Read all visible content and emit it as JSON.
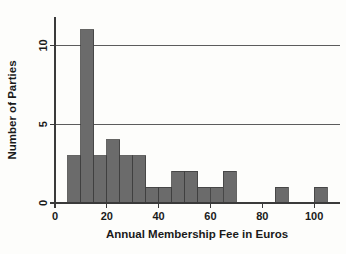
{
  "chart_data": {
    "type": "bar",
    "title": "",
    "xlabel": "Annual Membership Fee in Euros",
    "ylabel": "Number of Parties",
    "xlim": [
      0,
      110
    ],
    "ylim": [
      0,
      11.8
    ],
    "xticks": [
      0,
      20,
      40,
      60,
      80,
      100
    ],
    "xticklabels": [
      "0",
      "20",
      "40",
      "60",
      "80",
      "100"
    ],
    "yticks": [
      0,
      5,
      10
    ],
    "yticklabels": [
      "0",
      "5",
      "10"
    ],
    "grid": "horizontal-at-5-and-10",
    "legend": "none",
    "bin_width": 5,
    "bar_color": "#6b6b6b",
    "bar_edge_color": "#3f3f3f",
    "bins": [
      {
        "start": 5,
        "end": 10,
        "count": 3
      },
      {
        "start": 10,
        "end": 15,
        "count": 11
      },
      {
        "start": 15,
        "end": 20,
        "count": 3
      },
      {
        "start": 20,
        "end": 25,
        "count": 4
      },
      {
        "start": 25,
        "end": 30,
        "count": 3
      },
      {
        "start": 30,
        "end": 35,
        "count": 3
      },
      {
        "start": 35,
        "end": 40,
        "count": 1
      },
      {
        "start": 40,
        "end": 45,
        "count": 1
      },
      {
        "start": 45,
        "end": 50,
        "count": 2
      },
      {
        "start": 50,
        "end": 55,
        "count": 2
      },
      {
        "start": 55,
        "end": 60,
        "count": 1
      },
      {
        "start": 60,
        "end": 65,
        "count": 1
      },
      {
        "start": 65,
        "end": 70,
        "count": 2
      },
      {
        "start": 85,
        "end": 90,
        "count": 1
      },
      {
        "start": 100,
        "end": 105,
        "count": 1
      }
    ],
    "categories": [
      "5-10",
      "10-15",
      "15-20",
      "20-25",
      "25-30",
      "30-35",
      "35-40",
      "40-45",
      "45-50",
      "50-55",
      "55-60",
      "60-65",
      "65-70",
      "85-90",
      "100-105"
    ],
    "values": [
      3,
      11,
      3,
      4,
      3,
      3,
      1,
      1,
      2,
      2,
      1,
      1,
      2,
      1,
      1
    ]
  },
  "axes": {
    "x_title": "Annual Membership Fee in Euros",
    "y_title": "Number of Parties",
    "x_tick_0": "0",
    "x_tick_1": "20",
    "x_tick_2": "40",
    "x_tick_3": "60",
    "x_tick_4": "80",
    "x_tick_5": "100",
    "y_tick_0": "0",
    "y_tick_1": "5",
    "y_tick_2": "10"
  },
  "colors": {
    "bar": "#6b6b6b",
    "bar_edge": "#3f3f3f",
    "axis": "#3a3a3a",
    "grid": "#4a4a4a",
    "background": "#fdfdfb"
  }
}
